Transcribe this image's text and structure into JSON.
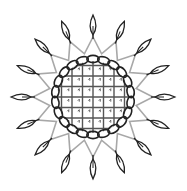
{
  "illustration": {
    "subject": "sunflower-line-art",
    "center": [
      93,
      97
    ],
    "petal_count": 16,
    "petal_inner_radius": 62,
    "petal_outer_radius": 82,
    "star_points": 16,
    "star_outer_radius": 60,
    "star_inner_radius": 44,
    "chain_link_count": 22,
    "chain_radius": 38,
    "grid_lines": 7,
    "colors": {
      "background": "#ffffff",
      "ink": "#222222",
      "star": "#a8a8a8",
      "grid": "#555555"
    }
  }
}
